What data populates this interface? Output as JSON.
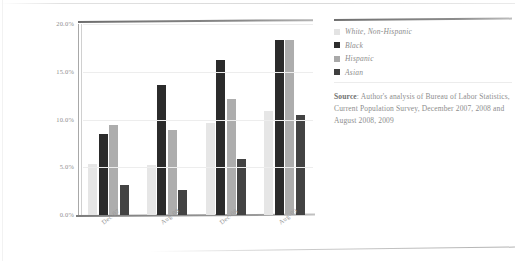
{
  "chart_data": {
    "type": "bar",
    "title": "",
    "xlabel": "",
    "ylabel": "",
    "ylim": [
      0,
      20
    ],
    "ytick_labels": [
      "20.0%",
      "15.0%",
      "10.0%",
      "5.0%",
      "0.0%"
    ],
    "ytick_values": [
      20,
      15,
      10,
      5,
      0
    ],
    "grid": true,
    "legend_position": "right",
    "categories": [
      "Dec-07",
      "Aug-08",
      "Dec-08",
      "Aug-09"
    ],
    "series": [
      {
        "name": "White, Non-Hispanic",
        "color": "#e6e6e6",
        "values": [
          5.3,
          5.2,
          9.6,
          10.9
        ]
      },
      {
        "name": "Black",
        "color": "#2b2b2b",
        "values": [
          8.5,
          13.6,
          16.2,
          18.3
        ]
      },
      {
        "name": "Hispanic",
        "color": "#adadad",
        "values": [
          9.4,
          8.9,
          12.1,
          18.3
        ]
      },
      {
        "name": "Asian",
        "color": "#434343",
        "values": [
          3.1,
          2.6,
          5.9,
          10.5
        ]
      }
    ]
  },
  "legend": {
    "items": [
      {
        "label": "White, Non-Hispanic"
      },
      {
        "label": "Black"
      },
      {
        "label": "Hispanic"
      },
      {
        "label": "Asian"
      }
    ]
  },
  "source": {
    "label": "Source",
    "separator": ": ",
    "text": "Author's analysis of Bureau of Labor Statistics, Current Population Survey, December 2007, 2008 and August 2008, 2009"
  }
}
